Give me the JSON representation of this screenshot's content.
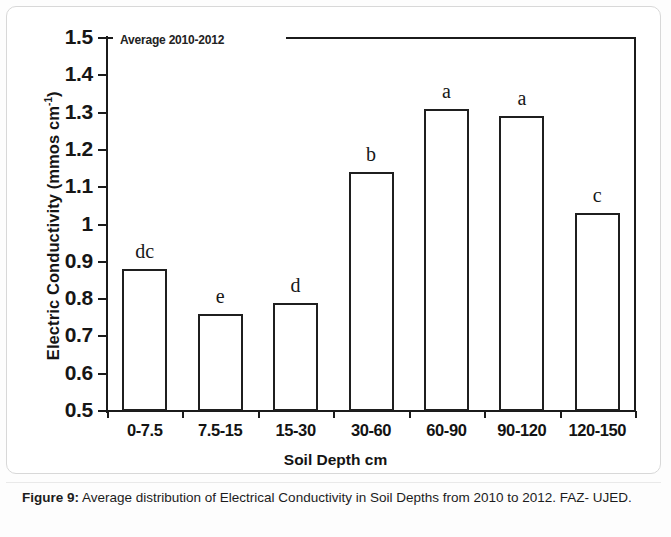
{
  "figure": {
    "caption_label": "Figure 9:",
    "caption_text": " Average distribution of Electrical Conductivity in Soil Depths from 2010 to 2012. FAZ- UJED."
  },
  "chart_data": {
    "type": "bar",
    "title": "",
    "annotation": "Average 2010-2012",
    "xlabel": "Soil Depth cm",
    "ylabel": "Electric Conductivity (mmos cm-1)",
    "ylabel_main": "Electric Conductivity (mmos cm",
    "ylabel_sup": "-1",
    "ylabel_tail": ")",
    "categories": [
      "0-7.5",
      "7.5-15",
      "15-30",
      "30-60",
      "60-90",
      "90-120",
      "120-150"
    ],
    "values": [
      0.88,
      0.76,
      0.79,
      1.14,
      1.31,
      1.29,
      1.03
    ],
    "point_labels": [
      "dc",
      "e",
      "d",
      "b",
      "a",
      "a",
      "c"
    ],
    "ylim": [
      0.5,
      1.5
    ],
    "ytick_labels": [
      "1.5",
      "1.4",
      "1.3",
      "1.2",
      "1.1",
      "1",
      "0.9",
      "0.8",
      "0.7",
      "0.6",
      "0.5"
    ],
    "ytick_values": [
      1.5,
      1.4,
      1.3,
      1.2,
      1.1,
      1.0,
      0.9,
      0.8,
      0.7,
      0.6,
      0.5
    ],
    "grid": false,
    "legend": false,
    "bar_fill_color": "#ffffff",
    "bar_edge_color": "#1f1f1f",
    "axis_color": "#1b1b1b"
  }
}
